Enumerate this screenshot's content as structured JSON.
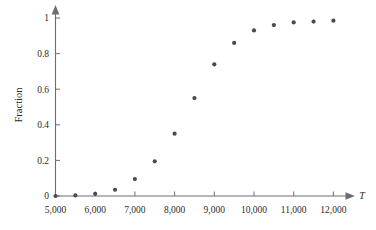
{
  "chart_data": {
    "type": "scatter",
    "title": "",
    "subtitle": "",
    "xlabel": "T",
    "ylabel": "Fraction",
    "xlim": [
      5000,
      12250
    ],
    "ylim": [
      0,
      1.04
    ],
    "grid": false,
    "legend": null,
    "legend_position": "none",
    "marker": {
      "shape": "circle",
      "color": "#4a4a52",
      "size_px": 4.2
    },
    "axis_style": {
      "color": "#6d6d75",
      "arrow_x_end": true,
      "arrow_y_end": true,
      "spines": [
        "left",
        "bottom"
      ]
    },
    "x_ticks": [
      5000,
      6000,
      7000,
      8000,
      9000,
      10000,
      11000,
      12000
    ],
    "x_tick_labels": [
      "5,000",
      "6,000",
      "7,000",
      "8,000",
      "9,000",
      "10,000",
      "11,000",
      "12,000"
    ],
    "y_ticks": [
      0,
      0.2,
      0.4,
      0.6,
      0.8,
      1
    ],
    "y_tick_labels": [
      "0",
      "0.2",
      "0.4",
      "0.6",
      "0.8",
      "1"
    ],
    "x": [
      5000,
      5500,
      6000,
      6500,
      7000,
      7500,
      8000,
      8500,
      9000,
      9500,
      10000,
      10500,
      11000,
      11500,
      12000
    ],
    "values": [
      0.0,
      0.003,
      0.012,
      0.035,
      0.095,
      0.195,
      0.35,
      0.55,
      0.74,
      0.86,
      0.93,
      0.96,
      0.975,
      0.98,
      0.985
    ],
    "series": [
      {
        "name": "Fraction",
        "x": [
          5000,
          5500,
          6000,
          6500,
          7000,
          7500,
          8000,
          8500,
          9000,
          9500,
          10000,
          10500,
          11000,
          11500,
          12000
        ],
        "values": [
          0.0,
          0.003,
          0.012,
          0.035,
          0.095,
          0.195,
          0.35,
          0.55,
          0.74,
          0.86,
          0.93,
          0.96,
          0.975,
          0.98,
          0.985
        ]
      }
    ]
  }
}
